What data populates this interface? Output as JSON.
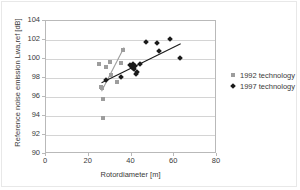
{
  "chart_data": {
    "type": "scatter",
    "title": "",
    "xlabel": "Rotordiameter [m]",
    "ylabel": "Reference noise emission Lwa,ref [dB]",
    "xlim": [
      0,
      80
    ],
    "ylim": [
      90,
      104
    ],
    "xticks": [
      0,
      20,
      40,
      60,
      80
    ],
    "yticks": [
      90,
      92,
      94,
      96,
      98,
      100,
      102,
      104
    ],
    "grid": "horizontal",
    "legend_position": "right",
    "series": [
      {
        "name": "1992 technology",
        "marker": "square",
        "color": "#9d9d9d",
        "points": [
          [
            25.0,
            99.5
          ],
          [
            25.5,
            97.1
          ],
          [
            26.0,
            97.0
          ],
          [
            26.2,
            96.9
          ],
          [
            26.5,
            95.8
          ],
          [
            26.8,
            93.8
          ],
          [
            30.0,
            99.7
          ],
          [
            30.5,
            98.3
          ],
          [
            33.0,
            97.6
          ],
          [
            35.0,
            99.6
          ],
          [
            36.0,
            100.9
          ],
          [
            28.0,
            99.2
          ]
        ],
        "trendline": {
          "x": [
            26.0,
            36.5
          ],
          "y": [
            96.6,
            101.2
          ]
        }
      },
      {
        "name": "1997 technology",
        "marker": "diamond",
        "color": "#1a1a1a",
        "points": [
          [
            28.0,
            97.8
          ],
          [
            35.0,
            98.1
          ],
          [
            39.5,
            99.4
          ],
          [
            40.0,
            99.3
          ],
          [
            40.2,
            99.2
          ],
          [
            40.5,
            99.1
          ],
          [
            40.8,
            99.5
          ],
          [
            41.0,
            99.0
          ],
          [
            41.5,
            99.3
          ],
          [
            42.0,
            98.4
          ],
          [
            42.5,
            98.6
          ],
          [
            44.0,
            99.5
          ],
          [
            47.0,
            101.8
          ],
          [
            52.0,
            101.7
          ],
          [
            53.0,
            100.8
          ],
          [
            58.0,
            102.1
          ],
          [
            62.5,
            100.1
          ]
        ],
        "trendline": {
          "x": [
            26.0,
            63.0
          ],
          "y": [
            97.5,
            101.6
          ]
        }
      }
    ]
  },
  "legend": {
    "items": [
      {
        "label": "1992 technology",
        "marker": "square"
      },
      {
        "label": "1997 technology",
        "marker": "diamond"
      }
    ]
  }
}
